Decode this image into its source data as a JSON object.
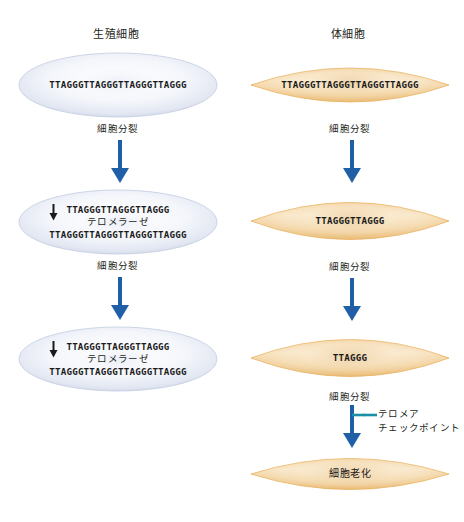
{
  "diagram": {
    "title_germ": "生殖細胞",
    "title_soma": "体細胞",
    "step_label": "細胞分裂",
    "telomerase_label": "テロメラーゼ",
    "checkpoint_label_line1": "テロメア",
    "checkpoint_label_line2": "チェックポイント",
    "senescence_label": "細胞老化"
  },
  "colors": {
    "arrow_blue": "#1f5fa8",
    "branch_teal": "#1b8fa8",
    "cell_blue_fill": "#eef1f8",
    "cell_blue_edge": "#c3cbe0",
    "cell_orange_fill": "#f6dfbb",
    "cell_orange_edge": "#e8a94e",
    "text": "#231f20"
  },
  "germ_cells": [
    {
      "name": "germ-cell-1",
      "sequences": [
        "TTAGGGTTAGGGTTAGGGTTAGGG"
      ],
      "has_telomerase": false
    },
    {
      "name": "germ-cell-2",
      "sequences": [
        "TTAGGGTTAGGGTTAGGG",
        "TTAGGGTTAGGGTTAGGGTTAGGG"
      ],
      "has_telomerase": true
    },
    {
      "name": "germ-cell-3",
      "sequences": [
        "TTAGGGTTAGGGTTAGGG",
        "TTAGGGTTAGGGTTAGGGTTAGGG"
      ],
      "has_telomerase": true
    }
  ],
  "somatic_cells": [
    {
      "name": "somatic-cell-1",
      "sequence": "TTAGGGTTAGGGTTAGGGTTAGGG"
    },
    {
      "name": "somatic-cell-2",
      "sequence": "TTAGGGTTAGGG"
    },
    {
      "name": "somatic-cell-3",
      "sequence": "TTAGGG"
    },
    {
      "name": "somatic-cell-4-senescent",
      "sequence": "細胞老化"
    }
  ],
  "step_labels": {
    "germ_1": "細胞分裂",
    "germ_2": "細胞分裂",
    "soma_1": "細胞分裂",
    "soma_2": "細胞分裂",
    "soma_3": "細胞分裂"
  },
  "germ_sequences_flat": {
    "c1_s1": "TTAGGGTTAGGGTTAGGGTTAGGG",
    "c2_s1": "TTAGGGTTAGGGTTAGGG",
    "c2_s2": "TTAGGGTTAGGGTTAGGGTTAGGG",
    "c3_s1": "TTAGGGTTAGGGTTAGGG",
    "c3_s2": "TTAGGGTTAGGGTTAGGGTTAGGG"
  },
  "soma_sequences_flat": {
    "c1": "TTAGGGTTAGGGTTAGGGTTAGGG",
    "c2": "TTAGGGTTAGGG",
    "c3": "TTAGGG",
    "c4": "細胞老化"
  }
}
